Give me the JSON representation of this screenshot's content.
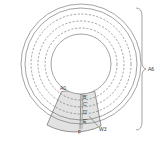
{
  "figure": {
    "type": "disk-sector-diagram",
    "labels": {
      "a0": "A0",
      "b": "B'",
      "c": "C'",
      "d": "D'",
      "e": "E'",
      "f": "F",
      "w3": "W3",
      "a6": "A6"
    },
    "colors": {
      "line": "#555555",
      "sector_fill": "#e2e2e2",
      "background": "#ffffff"
    }
  }
}
